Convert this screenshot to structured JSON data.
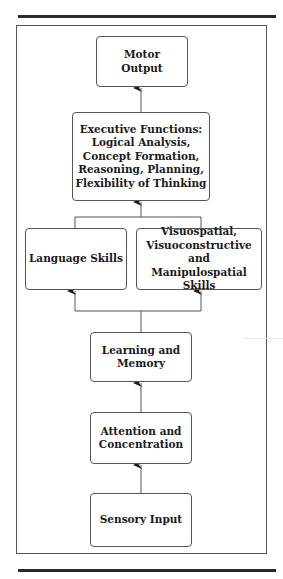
{
  "diagram": {
    "nodes": {
      "motor_output": "Motor\nOutput",
      "executive_functions": "Executive Functions:\nLogical Analysis,\nConcept Formation,\nReasoning, Planning,\nFlexibility of Thinking",
      "language_skills": "Language Skills",
      "visuospatial_skills": "Visuospatial,\nVisuoconstructive and\nManipulospatial Skills",
      "learning_memory": "Learning and\nMemory",
      "attention_concentration": "Attention and\nConcentration",
      "sensory_input": "Sensory Input"
    },
    "edges": [
      {
        "from": "sensory_input",
        "to": "attention_concentration"
      },
      {
        "from": "attention_concentration",
        "to": "learning_memory"
      },
      {
        "from": "learning_memory",
        "to": "language_skills"
      },
      {
        "from": "learning_memory",
        "to": "visuospatial_skills"
      },
      {
        "from": "language_skills",
        "to": "executive_functions"
      },
      {
        "from": "visuospatial_skills",
        "to": "executive_functions"
      },
      {
        "from": "executive_functions",
        "to": "motor_output"
      }
    ],
    "colors": {
      "line": "#555555",
      "text": "#1a1a1a",
      "rule": "#2a2a2a"
    }
  }
}
